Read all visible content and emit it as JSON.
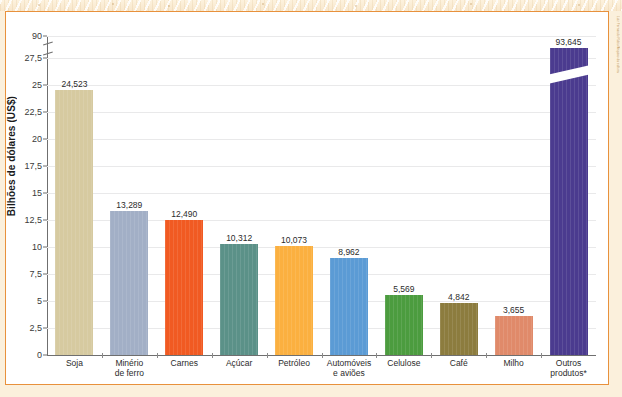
{
  "chart_data": {
    "type": "bar",
    "title": "",
    "subtitle": "",
    "xlabel": "",
    "ylabel": "Bilhões de dólares (US$)",
    "ylim": [
      0,
      27.5
    ],
    "y_break": {
      "present": true,
      "from": 27.5,
      "to": 90,
      "top_label": "90"
    },
    "grid": true,
    "legend": false,
    "yticks": [
      "0",
      "2,5",
      "5",
      "7,5",
      "10",
      "12,5",
      "15",
      "17,5",
      "20",
      "22,5",
      "25",
      "27,5",
      "90"
    ],
    "ytick_values": [
      0,
      2.5,
      5,
      7.5,
      10,
      12.5,
      15,
      17.5,
      20,
      22.5,
      25,
      27.5,
      90
    ],
    "categories": [
      "Soja",
      "Minério de ferro",
      "Carnes",
      "Açúcar",
      "Petróleo",
      "Automóveis e aviões",
      "Celulose",
      "Café",
      "Milho",
      "Outros produtos*"
    ],
    "values": [
      24.523,
      13.289,
      12.49,
      10.312,
      10.073,
      8.962,
      5.569,
      4.842,
      3.655,
      93.645
    ],
    "bars": [
      {
        "label": "Soja",
        "label_line1": "Soja",
        "label_line2": "",
        "value": 24.523,
        "value_label": "24,523",
        "color": "#d6caa0",
        "truncated": false
      },
      {
        "label": "Minério de ferro",
        "label_line1": "Minério",
        "label_line2": "de ferro",
        "value": 13.289,
        "value_label": "13,289",
        "color": "#a2afc6",
        "truncated": false
      },
      {
        "label": "Carnes",
        "label_line1": "Carnes",
        "label_line2": "",
        "value": 12.49,
        "value_label": "12,490",
        "color": "#f15a22",
        "truncated": false
      },
      {
        "label": "Açúcar",
        "label_line1": "Açúcar",
        "label_line2": "",
        "value": 10.312,
        "value_label": "10,312",
        "color": "#5b9188",
        "truncated": false
      },
      {
        "label": "Petróleo",
        "label_line1": "Petróleo",
        "label_line2": "",
        "value": 10.073,
        "value_label": "10,073",
        "color": "#fbb040",
        "truncated": false
      },
      {
        "label": "Automóveis e aviões",
        "label_line1": "Automóveis",
        "label_line2": "e aviões",
        "value": 8.962,
        "value_label": "8,962",
        "color": "#5b9bd5",
        "truncated": false
      },
      {
        "label": "Celulose",
        "label_line1": "Celulose",
        "label_line2": "",
        "value": 5.569,
        "value_label": "5,569",
        "color": "#4c9c3f",
        "truncated": false
      },
      {
        "label": "Café",
        "label_line1": "Café",
        "label_line2": "",
        "value": 4.842,
        "value_label": "4,842",
        "color": "#8c7c3e",
        "truncated": false
      },
      {
        "label": "Milho",
        "label_line1": "Milho",
        "label_line2": "",
        "value": 3.655,
        "value_label": "3,655",
        "color": "#e08a6a",
        "truncated": false
      },
      {
        "label": "Outros produtos*",
        "label_line1": "Outros",
        "label_line2": "produtos*",
        "value": 93.645,
        "value_label": "93,645",
        "color": "#4b3b8f",
        "truncated": true
      }
    ],
    "colors": {
      "panel_border": "#e8913c",
      "gridline": "#e9e9ea",
      "axis": "#6f6f6f",
      "background": "#ffffff"
    }
  },
  "credit": {
    "text": "Luiz Fernando Rubio/Arquivo da editora"
  }
}
